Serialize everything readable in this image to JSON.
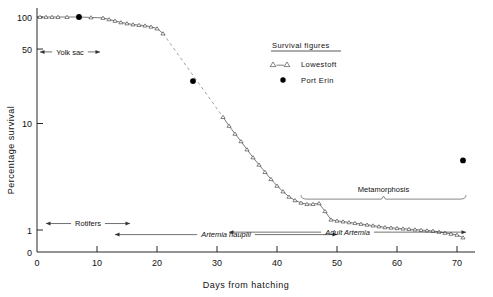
{
  "chart_data": {
    "type": "line",
    "title": "",
    "xlabel": "Days  from  hatching",
    "ylabel": "Percentage  survival",
    "xlim": [
      0,
      73
    ],
    "ylim": [
      0.8,
      115
    ],
    "yscale": "log",
    "grid": false,
    "legend_position": "top-center-right",
    "legend_title": "Survival figures",
    "x_ticks": [
      0,
      10,
      20,
      30,
      40,
      50,
      60,
      70
    ],
    "x_tick_labels": [
      "0",
      "10",
      "20",
      "30",
      "40",
      "50",
      "60",
      "70"
    ],
    "y_ticks": [
      1,
      10,
      50,
      100
    ],
    "y_tick_labels": [
      "1",
      "10",
      "50",
      "100"
    ],
    "y_origin_label": "0",
    "series": [
      {
        "name": "Lowestoft",
        "marker": "open-triangle",
        "linestyle": "solid-with-dashed-gap",
        "x": [
          0.5,
          1.5,
          2.5,
          3.5,
          5.0,
          7.0,
          9.0,
          11.0,
          12.0,
          13.0,
          14.0,
          15.0,
          16.0,
          17.0,
          18.0,
          19.0,
          20.0,
          21.0,
          31.0,
          32.0,
          33.0,
          34.0,
          35.0,
          36.0,
          37.0,
          38.0,
          39.0,
          40.0,
          41.0,
          42.0,
          43.0,
          44.0,
          45.0,
          46.0,
          47.0,
          48.0,
          49.0,
          50.0,
          51.0,
          52.0,
          53.0,
          54.0,
          55.0,
          56.0,
          57.0,
          58.0,
          59.0,
          60.0,
          61.0,
          62.0,
          63.0,
          64.0,
          65.0,
          66.0,
          67.0,
          68.0,
          69.0,
          70.0,
          71.0
        ],
        "y": [
          100,
          100,
          100,
          100,
          100,
          100,
          99,
          98,
          95,
          92,
          89,
          87,
          85,
          84,
          83,
          81,
          78,
          70,
          11.5,
          9.5,
          8.0,
          6.8,
          5.7,
          4.8,
          4.1,
          3.5,
          3.0,
          2.6,
          2.3,
          2.05,
          1.9,
          1.8,
          1.75,
          1.75,
          1.78,
          1.5,
          1.25,
          1.22,
          1.2,
          1.18,
          1.16,
          1.14,
          1.12,
          1.1,
          1.08,
          1.06,
          1.05,
          1.04,
          1.03,
          1.02,
          1.01,
          1.0,
          0.99,
          0.98,
          0.96,
          0.94,
          0.92,
          0.9,
          0.85
        ],
        "dashed_gap": {
          "from_x": 21.0,
          "from_y": 70,
          "to_x": 31.0,
          "to_y": 11.5
        }
      },
      {
        "name": "Port Erin",
        "marker": "filled-circle",
        "linestyle": "none",
        "x": [
          7.0,
          26.0,
          71.0
        ],
        "y": [
          100,
          25,
          4.5
        ]
      }
    ],
    "annotations": [
      {
        "name": "yolk-sac",
        "text": "Yolk sac",
        "style": "double-arrow",
        "x_start": 0.5,
        "x_end": 10.5,
        "y": 47
      },
      {
        "name": "rotifers",
        "text": "Rotifers",
        "style": "double-arrow",
        "x_start": 1.5,
        "x_end": 15.5,
        "y": 1.15
      },
      {
        "name": "artemia-nauplii",
        "text": "Artemia  nauplii",
        "style": "double-arrow-italic",
        "x_start": 13.0,
        "x_end": 50.0,
        "y": 0.905
      },
      {
        "name": "adult-artemia",
        "text": "Adult  Artemia",
        "style": "double-arrow-italic",
        "x_start": 32.0,
        "x_end": 71.5,
        "y": 0.955
      },
      {
        "name": "metamorphosis",
        "text": "Metamorphosis",
        "style": "brace",
        "x_start": 44.0,
        "x_end": 71.5,
        "y": 1.95
      }
    ]
  },
  "legend": {
    "title": "Survival figures",
    "entries": [
      {
        "label": "Lowestoft",
        "marker": "open-triangle-line"
      },
      {
        "label": "Port Erin",
        "marker": "filled-circle"
      }
    ]
  },
  "axes": {
    "x_title": "Days  from  hatching",
    "y_title": "Percentage  survival"
  },
  "colors": {
    "ink": "#111111",
    "line": "#444444",
    "dashed": "#777777",
    "marker_fill": "#ffffff",
    "dot_fill": "#000000",
    "background": "#ffffff"
  }
}
